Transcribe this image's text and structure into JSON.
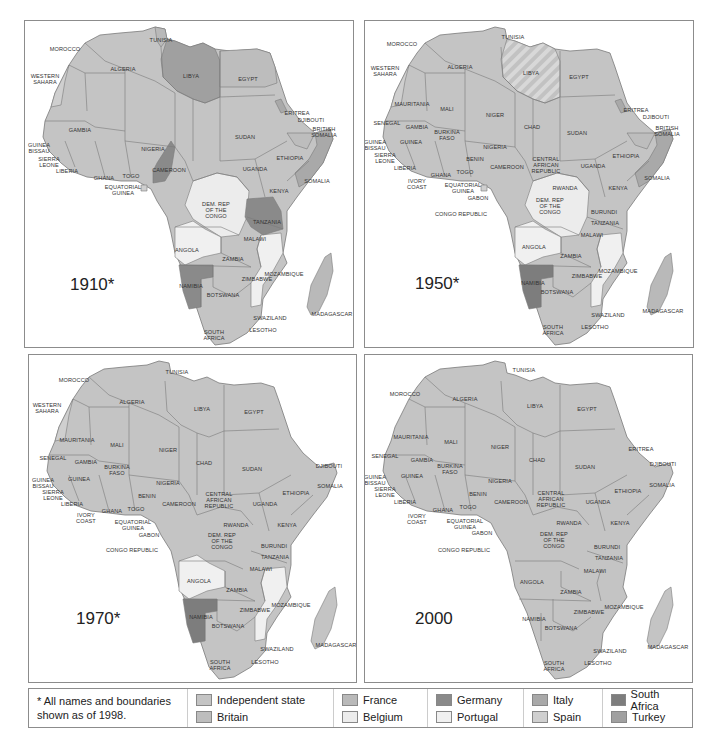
{
  "colors": {
    "independent": "#c4c4c4",
    "britain": "#bdbdbd",
    "france": "#b9b9b9",
    "belgium": "#ececec",
    "germany": "#8a8a8a",
    "portugal": "#f0f0f0",
    "italy": "#a9a9a9",
    "spain": "#cfcfcf",
    "south_africa": "#7d7d7d",
    "turkey": "#a0a0a0",
    "border": "#7a7a7a"
  },
  "panels": [
    {
      "year": "1910*",
      "labels": [
        {
          "t": "MOROCCO",
          "x": 40,
          "y": 28
        },
        {
          "t": "TUNISIA",
          "x": 136,
          "y": 19
        },
        {
          "t": "WESTERN\nSAHARA",
          "x": 20,
          "y": 58
        },
        {
          "t": "ALGERIA",
          "x": 98,
          "y": 48
        },
        {
          "t": "LIBYA",
          "x": 166,
          "y": 55
        },
        {
          "t": "EGYPT",
          "x": 223,
          "y": 58
        },
        {
          "t": "ERITREA",
          "x": 272,
          "y": 92
        },
        {
          "t": "DJIBOUTI",
          "x": 286,
          "y": 99
        },
        {
          "t": "BRITISH\nSOMALIA",
          "x": 299,
          "y": 111
        },
        {
          "t": "GAMBIA",
          "x": 55,
          "y": 109
        },
        {
          "t": "GUINEA\nBISSAU",
          "x": 14,
          "y": 127
        },
        {
          "t": "SIERRA\nLEONE",
          "x": 24,
          "y": 141
        },
        {
          "t": "SUDAN",
          "x": 220,
          "y": 116
        },
        {
          "t": "NIGERIA",
          "x": 128,
          "y": 128
        },
        {
          "t": "ETHIOPIA",
          "x": 265,
          "y": 137
        },
        {
          "t": "LIBERIA",
          "x": 42,
          "y": 150
        },
        {
          "t": "CAMEROON",
          "x": 144,
          "y": 149
        },
        {
          "t": "UGANDA",
          "x": 230,
          "y": 148
        },
        {
          "t": "GHANA",
          "x": 79,
          "y": 157
        },
        {
          "t": "TOGO",
          "x": 106,
          "y": 155
        },
        {
          "t": "SOMALIA",
          "x": 292,
          "y": 160
        },
        {
          "t": "EQUATORIAL\nGUINEA",
          "x": 98,
          "y": 169
        },
        {
          "t": "KENYA",
          "x": 254,
          "y": 170
        },
        {
          "t": "DEM. REP\nOF THE\nCONGO",
          "x": 191,
          "y": 189
        },
        {
          "t": "TANZANIA",
          "x": 242,
          "y": 201
        },
        {
          "t": "MALAWI",
          "x": 230,
          "y": 218
        },
        {
          "t": "ANGOLA",
          "x": 162,
          "y": 229
        },
        {
          "t": "ZAMBIA",
          "x": 208,
          "y": 238
        },
        {
          "t": "MOZAMBIQUE",
          "x": 259,
          "y": 253
        },
        {
          "t": "ZIMBABWE",
          "x": 232,
          "y": 258
        },
        {
          "t": "NAMIBIA",
          "x": 166,
          "y": 265
        },
        {
          "t": "BOTSWANA",
          "x": 198,
          "y": 274
        },
        {
          "t": "SWAZILAND",
          "x": 245,
          "y": 297
        },
        {
          "t": "MADAGASCAR",
          "x": 307,
          "y": 293
        },
        {
          "t": "SOUTH\nAFRICA",
          "x": 189,
          "y": 314
        },
        {
          "t": "LESOTHO",
          "x": 238,
          "y": 309
        }
      ]
    },
    {
      "year": "1950*",
      "labels": [
        {
          "t": "MOROCCO",
          "x": 37,
          "y": 23
        },
        {
          "t": "TUNISIA",
          "x": 148,
          "y": 16
        },
        {
          "t": "WESTERN\nSAHARA",
          "x": 20,
          "y": 50
        },
        {
          "t": "ALGERIA",
          "x": 95,
          "y": 46
        },
        {
          "t": "LIBYA",
          "x": 166,
          "y": 52
        },
        {
          "t": "EGYPT",
          "x": 214,
          "y": 56
        },
        {
          "t": "MAURITANIA",
          "x": 47,
          "y": 83
        },
        {
          "t": "MALI",
          "x": 82,
          "y": 88
        },
        {
          "t": "NIGER",
          "x": 130,
          "y": 94
        },
        {
          "t": "ERITREA",
          "x": 271,
          "y": 89
        },
        {
          "t": "DJIBOUTI",
          "x": 291,
          "y": 96
        },
        {
          "t": "BRITISH\nSOMALIA",
          "x": 302,
          "y": 110
        },
        {
          "t": "SENEGAL",
          "x": 22,
          "y": 102
        },
        {
          "t": "GAMBIA",
          "x": 52,
          "y": 106
        },
        {
          "t": "CHAD",
          "x": 167,
          "y": 106
        },
        {
          "t": "BURKINA\nFASO",
          "x": 82,
          "y": 114
        },
        {
          "t": "SUDAN",
          "x": 212,
          "y": 112
        },
        {
          "t": "GUINEA\nBISSAU",
          "x": 10,
          "y": 124
        },
        {
          "t": "GUINEA",
          "x": 46,
          "y": 121
        },
        {
          "t": "NIGERIA",
          "x": 130,
          "y": 126
        },
        {
          "t": "SIERRA\nLEONE",
          "x": 20,
          "y": 137
        },
        {
          "t": "BENIN",
          "x": 110,
          "y": 138
        },
        {
          "t": "ETHIOPIA",
          "x": 261,
          "y": 135
        },
        {
          "t": "CENTRAL\nAFRICAN\nREPUBLIC",
          "x": 181,
          "y": 144
        },
        {
          "t": "LIBERIA",
          "x": 40,
          "y": 147
        },
        {
          "t": "CAMEROON",
          "x": 142,
          "y": 146
        },
        {
          "t": "UGANDA",
          "x": 228,
          "y": 145
        },
        {
          "t": "GHANA",
          "x": 76,
          "y": 154
        },
        {
          "t": "TOGO",
          "x": 100,
          "y": 151
        },
        {
          "t": "SOMALIA",
          "x": 292,
          "y": 157
        },
        {
          "t": "IVORY\nCOAST",
          "x": 52,
          "y": 163
        },
        {
          "t": "EQUATORIAL\nGUINEA",
          "x": 98,
          "y": 167
        },
        {
          "t": "RWANDA",
          "x": 200,
          "y": 167
        },
        {
          "t": "KENYA",
          "x": 253,
          "y": 167
        },
        {
          "t": "GABON",
          "x": 113,
          "y": 177
        },
        {
          "t": "DEM. REP\nOF THE\nCONGO",
          "x": 185,
          "y": 185
        },
        {
          "t": "CONGO REPUBLIC",
          "x": 96,
          "y": 193
        },
        {
          "t": "BURUNDI",
          "x": 239,
          "y": 191
        },
        {
          "t": "TANZANIA",
          "x": 240,
          "y": 202
        },
        {
          "t": "MALAWI",
          "x": 227,
          "y": 214
        },
        {
          "t": "ANGOLA",
          "x": 169,
          "y": 226
        },
        {
          "t": "ZAMBIA",
          "x": 206,
          "y": 235
        },
        {
          "t": "MOZAMBIQUE",
          "x": 253,
          "y": 250
        },
        {
          "t": "ZIMBABWE",
          "x": 222,
          "y": 255
        },
        {
          "t": "NAMIBIA",
          "x": 168,
          "y": 262
        },
        {
          "t": "BOTSWANA",
          "x": 192,
          "y": 271
        },
        {
          "t": "MADAGASCAR",
          "x": 298,
          "y": 290
        },
        {
          "t": "SWAZILAND",
          "x": 243,
          "y": 294
        },
        {
          "t": "SOUTH\nAFRICA",
          "x": 188,
          "y": 309
        },
        {
          "t": "LESOTHO",
          "x": 230,
          "y": 306
        }
      ]
    },
    {
      "year": "1970*",
      "labels": [
        {
          "t": "MOROCCO",
          "x": 45,
          "y": 25
        },
        {
          "t": "TUNISIA",
          "x": 148,
          "y": 17
        },
        {
          "t": "WESTERN\nSAHARA",
          "x": 18,
          "y": 53
        },
        {
          "t": "ALGERIA",
          "x": 103,
          "y": 47
        },
        {
          "t": "LIBYA",
          "x": 173,
          "y": 54
        },
        {
          "t": "EGYPT",
          "x": 225,
          "y": 57
        },
        {
          "t": "MAURITANIA",
          "x": 48,
          "y": 85
        },
        {
          "t": "MALI",
          "x": 88,
          "y": 90
        },
        {
          "t": "NIGER",
          "x": 139,
          "y": 95
        },
        {
          "t": "SENEGAL",
          "x": 24,
          "y": 103
        },
        {
          "t": "GAMBIA",
          "x": 57,
          "y": 107
        },
        {
          "t": "CHAD",
          "x": 175,
          "y": 108
        },
        {
          "t": "DJIBOUTI",
          "x": 300,
          "y": 111
        },
        {
          "t": "BURKINA\nFASO",
          "x": 88,
          "y": 115
        },
        {
          "t": "SUDAN",
          "x": 223,
          "y": 114
        },
        {
          "t": "GUINEA\nBISSAU",
          "x": 14,
          "y": 128
        },
        {
          "t": "GUINEA",
          "x": 50,
          "y": 124
        },
        {
          "t": "NIGERIA",
          "x": 139,
          "y": 128
        },
        {
          "t": "SIERRA\nLEONE",
          "x": 24,
          "y": 140
        },
        {
          "t": "SOMALIA",
          "x": 301,
          "y": 131
        },
        {
          "t": "BENIN",
          "x": 118,
          "y": 141
        },
        {
          "t": "ETHIOPIA",
          "x": 267,
          "y": 138
        },
        {
          "t": "CENTRAL\nAFRICAN\nREPUBLIC",
          "x": 190,
          "y": 145
        },
        {
          "t": "LIBERIA",
          "x": 43,
          "y": 149
        },
        {
          "t": "CAMEROON",
          "x": 150,
          "y": 149
        },
        {
          "t": "UGANDA",
          "x": 236,
          "y": 149
        },
        {
          "t": "GHANA",
          "x": 83,
          "y": 156
        },
        {
          "t": "TOGO",
          "x": 107,
          "y": 154
        },
        {
          "t": "IVORY\nCOAST",
          "x": 57,
          "y": 163
        },
        {
          "t": "EQUATORIAL\nGUINEA",
          "x": 104,
          "y": 170
        },
        {
          "t": "RWANDA",
          "x": 207,
          "y": 170
        },
        {
          "t": "KENYA",
          "x": 258,
          "y": 170
        },
        {
          "t": "GABON",
          "x": 120,
          "y": 180
        },
        {
          "t": "DEM. REP\nOF THE\nCONGO",
          "x": 193,
          "y": 186
        },
        {
          "t": "CONGO REPUBLIC",
          "x": 103,
          "y": 195
        },
        {
          "t": "BURUNDI",
          "x": 245,
          "y": 191
        },
        {
          "t": "TANZANIA",
          "x": 246,
          "y": 202
        },
        {
          "t": "MALAWI",
          "x": 232,
          "y": 214
        },
        {
          "t": "ANGOLA",
          "x": 170,
          "y": 226
        },
        {
          "t": "ZAMBIA",
          "x": 208,
          "y": 235
        },
        {
          "t": "MOZAMBIQUE",
          "x": 262,
          "y": 250
        },
        {
          "t": "ZIMBABWE",
          "x": 226,
          "y": 255
        },
        {
          "t": "NAMIBIA",
          "x": 172,
          "y": 262
        },
        {
          "t": "BOTSWANA",
          "x": 199,
          "y": 271
        },
        {
          "t": "MADAGASCAR",
          "x": 307,
          "y": 290
        },
        {
          "t": "SWAZILAND",
          "x": 248,
          "y": 294
        },
        {
          "t": "SOUTH\nAFRICA",
          "x": 191,
          "y": 310
        },
        {
          "t": "LESOTHO",
          "x": 236,
          "y": 307
        }
      ]
    },
    {
      "year": "2000",
      "labels": [
        {
          "t": "MOROCCO",
          "x": 40,
          "y": 39
        },
        {
          "t": "TUNISIA",
          "x": 159,
          "y": 15
        },
        {
          "t": "ALGERIA",
          "x": 100,
          "y": 44
        },
        {
          "t": "LIBYA",
          "x": 170,
          "y": 51
        },
        {
          "t": "EGYPT",
          "x": 222,
          "y": 54
        },
        {
          "t": "MAURITANIA",
          "x": 46,
          "y": 82
        },
        {
          "t": "MALI",
          "x": 86,
          "y": 87
        },
        {
          "t": "NIGER",
          "x": 135,
          "y": 92
        },
        {
          "t": "ERITREA",
          "x": 276,
          "y": 94
        },
        {
          "t": "SENEGAL",
          "x": 20,
          "y": 101
        },
        {
          "t": "GAMBIA",
          "x": 57,
          "y": 105
        },
        {
          "t": "CHAD",
          "x": 172,
          "y": 105
        },
        {
          "t": "DJIBOUTI",
          "x": 298,
          "y": 109
        },
        {
          "t": "BURKINA\nFASO",
          "x": 85,
          "y": 114
        },
        {
          "t": "SUDAN",
          "x": 220,
          "y": 112
        },
        {
          "t": "GUINEA\nBISSAU",
          "x": 10,
          "y": 125
        },
        {
          "t": "GUINEA",
          "x": 47,
          "y": 121
        },
        {
          "t": "NIGERIA",
          "x": 135,
          "y": 126
        },
        {
          "t": "SIERRA\nLEONE",
          "x": 20,
          "y": 137
        },
        {
          "t": "SOMALIA",
          "x": 297,
          "y": 130
        },
        {
          "t": "BENIN",
          "x": 113,
          "y": 139
        },
        {
          "t": "ETHIOPIA",
          "x": 263,
          "y": 136
        },
        {
          "t": "CENTRAL\nAFRICAN\nREPUBLIC",
          "x": 186,
          "y": 144
        },
        {
          "t": "LIBERIA",
          "x": 40,
          "y": 147
        },
        {
          "t": "CAMEROON",
          "x": 146,
          "y": 147
        },
        {
          "t": "UGANDA",
          "x": 233,
          "y": 147
        },
        {
          "t": "GHANA",
          "x": 78,
          "y": 155
        },
        {
          "t": "TOGO",
          "x": 103,
          "y": 152
        },
        {
          "t": "IVORY\nCOAST",
          "x": 52,
          "y": 164
        },
        {
          "t": "EQUATORIAL\nGUINEA",
          "x": 100,
          "y": 169
        },
        {
          "t": "RWANDA",
          "x": 204,
          "y": 168
        },
        {
          "t": "KENYA",
          "x": 255,
          "y": 168
        },
        {
          "t": "GABON",
          "x": 117,
          "y": 178
        },
        {
          "t": "DEM. REP\nOF THE\nCONGO",
          "x": 189,
          "y": 185
        },
        {
          "t": "CONGO REPUBLIC",
          "x": 99,
          "y": 195
        },
        {
          "t": "BURUNDI",
          "x": 242,
          "y": 192
        },
        {
          "t": "TANZANIA",
          "x": 244,
          "y": 203
        },
        {
          "t": "MALAWI",
          "x": 230,
          "y": 216
        },
        {
          "t": "ANGOLA",
          "x": 167,
          "y": 227
        },
        {
          "t": "ZAMBIA",
          "x": 206,
          "y": 237
        },
        {
          "t": "MOZAMBIQUE",
          "x": 259,
          "y": 252
        },
        {
          "t": "ZIMBABWE",
          "x": 224,
          "y": 257
        },
        {
          "t": "NAMIBIA",
          "x": 169,
          "y": 264
        },
        {
          "t": "BOTSWANA",
          "x": 196,
          "y": 273
        },
        {
          "t": "MADAGASCAR",
          "x": 303,
          "y": 292
        },
        {
          "t": "SWAZILAND",
          "x": 245,
          "y": 296
        },
        {
          "t": "SOUTH\nAFRICA",
          "x": 189,
          "y": 311
        },
        {
          "t": "LESOTHO",
          "x": 233,
          "y": 308
        }
      ]
    }
  ],
  "legend": {
    "note": "* All names and boundaries shown as of 1998.",
    "items": [
      {
        "label": "Independent state",
        "color": "#c4c4c4"
      },
      {
        "label": "Britain",
        "color": "#bdbdbd"
      },
      {
        "label": "France",
        "color": "#b9b9b9"
      },
      {
        "label": "Belgium",
        "color": "#ececec"
      },
      {
        "label": "Germany",
        "color": "#8a8a8a"
      },
      {
        "label": "Portugal",
        "color": "#f0f0f0"
      },
      {
        "label": "Italy",
        "color": "#a9a9a9"
      },
      {
        "label": "Spain",
        "color": "#cfcfcf"
      },
      {
        "label": "South Africa",
        "color": "#7d7d7d"
      },
      {
        "label": "Turkey",
        "color": "#a0a0a0"
      }
    ]
  }
}
